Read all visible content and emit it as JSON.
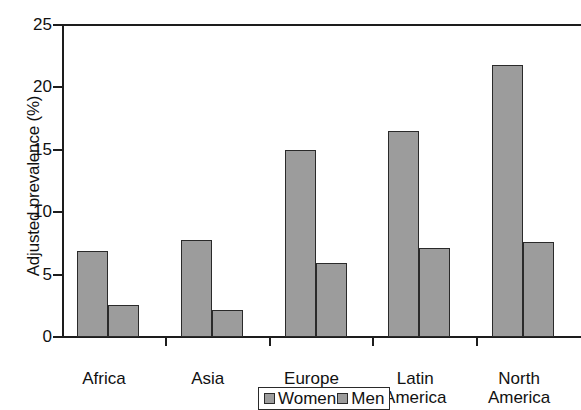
{
  "chart_data": {
    "type": "bar",
    "title": "",
    "xlabel": "",
    "ylabel": "Adjusted prevalence (%)",
    "categories": [
      "Africa",
      "Asia",
      "Europe",
      "Latin\nAmerica",
      "North\nAmerica"
    ],
    "category_lines": [
      [
        "Africa"
      ],
      [
        "Asia"
      ],
      [
        "Europe"
      ],
      [
        "Latin",
        "America"
      ],
      [
        "North",
        "America"
      ]
    ],
    "series": [
      {
        "name": "Women",
        "values": [
          6.9,
          7.8,
          15.0,
          16.5,
          21.8
        ],
        "color": "#9c9c9c"
      },
      {
        "name": "Men",
        "values": [
          2.6,
          2.2,
          5.9,
          7.1,
          7.6
        ],
        "color": "#9c9c9c"
      }
    ],
    "ylim": [
      0,
      25
    ],
    "yticks": [
      0,
      5,
      10,
      15,
      20,
      25
    ],
    "ytick_labels": [
      "0",
      "5",
      "10",
      "15",
      "20",
      "25"
    ],
    "grid": false,
    "legend_position": "bottom-center",
    "legend_entries": [
      "Women",
      "Men"
    ]
  },
  "axis": {
    "y_title": "Adjusted prevalence (%)"
  },
  "legend": {
    "women_label": "Women",
    "men_label": "Men"
  },
  "colors": {
    "bar_fill": "#9c9c9c",
    "bar_stroke": "#2a2a2a",
    "axis": "#1d1d1d",
    "text": "#111111",
    "background": "#ffffff"
  }
}
